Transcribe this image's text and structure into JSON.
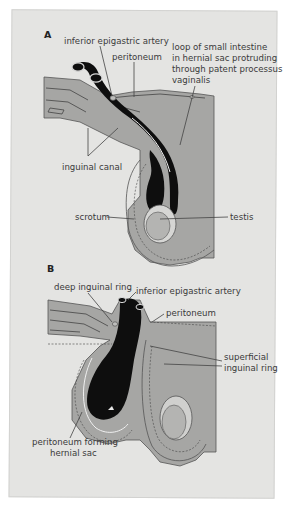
{
  "figure": {
    "background_color": "#e4e4e2",
    "tissue_color": "#a6a6a4",
    "tissue_dark_color": "#8f8f8d",
    "lumen_color": "#0e0e0e",
    "panels": [
      {
        "letter": "A",
        "labels": {
          "inferior_epigastric_artery": "inferior epigastric artery",
          "peritoneum": "peritoneum",
          "loop_line1": "loop of small intestine",
          "loop_line2": "in hernial sac protruding",
          "loop_line3": "through patent processus",
          "loop_line4": "vaginalis",
          "inguinal_canal": "inguinal canal",
          "scrotum": "scrotum",
          "testis": "testis"
        }
      },
      {
        "letter": "B",
        "labels": {
          "deep_inguinal_ring": "deep inguinal ring",
          "inferior_epigastric_artery": "inferior epigastric artery",
          "peritoneum": "peritoneum",
          "superficial_line1": "superficial",
          "superficial_line2": "inguinal ring",
          "sac_line1": "peritoneum forming",
          "sac_line2": "hernial sac"
        }
      }
    ]
  }
}
